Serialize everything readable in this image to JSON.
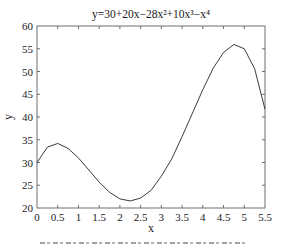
{
  "chart_data": {
    "type": "line",
    "title": "y=30+20x−28x²+10x³−x⁴",
    "xlabel": "x",
    "ylabel": "y",
    "xlim": [
      0,
      5.5
    ],
    "ylim": [
      20,
      60
    ],
    "x_ticks": [
      "0",
      "0.5",
      "1",
      "1.5",
      "2",
      "2.5",
      "3",
      "3.5",
      "4",
      "4.5",
      "5",
      "5.5"
    ],
    "y_ticks": [
      "20",
      "25",
      "30",
      "35",
      "40",
      "45",
      "50",
      "55",
      "60"
    ],
    "grid": false,
    "legend": null,
    "line_color": "#3a3a3a",
    "series": [
      {
        "name": "y=30+20x−28x²+10x³−x⁴",
        "x": [
          0,
          0.25,
          0.5,
          0.75,
          1,
          1.25,
          1.5,
          1.75,
          2,
          2.25,
          2.5,
          2.75,
          3,
          3.25,
          3.5,
          3.75,
          4,
          4.25,
          4.5,
          4.75,
          5,
          5.25,
          5.5
        ],
        "values": [
          30,
          33.37,
          34.19,
          33.09,
          31,
          28.36,
          25.69,
          23.45,
          22,
          21.55,
          22.19,
          23.87,
          27,
          30.78,
          35.69,
          40.84,
          46,
          50.71,
          54.19,
          55.94,
          55,
          50.62,
          41.69
        ]
      }
    ]
  },
  "caption": {
    "visible": "cropped at bottom edge; text illegible"
  }
}
